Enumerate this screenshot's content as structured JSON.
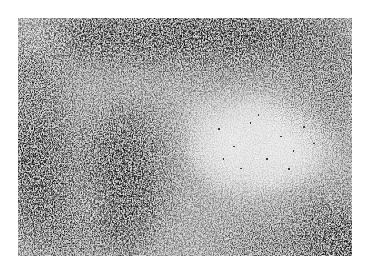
{
  "image": {
    "type": "grayscale histology micrograph",
    "background_color": "#ffffff",
    "tissue_base_color": "#d9d9d9",
    "stain_dark_color": "#3a3a3a",
    "pale_region_color": "#e6e6e6",
    "regions": [
      {
        "name": "dense-top-band",
        "tone": "dark"
      },
      {
        "name": "dense-left-edge",
        "tone": "dark"
      },
      {
        "name": "dense-lower-left-whorl",
        "tone": "dark"
      },
      {
        "name": "dense-bottom-right-corner",
        "tone": "dark"
      },
      {
        "name": "pale-center-right-area",
        "tone": "light"
      },
      {
        "name": "pale-top-left-patch",
        "tone": "light"
      }
    ]
  }
}
